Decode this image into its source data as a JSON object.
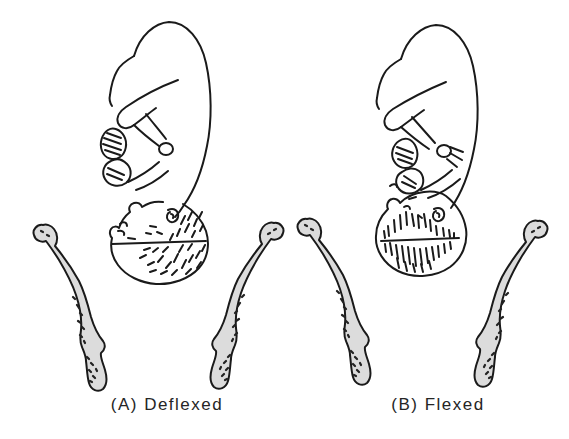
{
  "illustration": {
    "figures": [
      {
        "label": "(A) Deflexed"
      },
      {
        "label": "(B) Flexed"
      }
    ],
    "colors": {
      "background": "#ffffff",
      "line": "#1a1a1a",
      "bone_fill": "#dcdcdc",
      "stipple": "#222222",
      "label_text": "#252525"
    }
  }
}
